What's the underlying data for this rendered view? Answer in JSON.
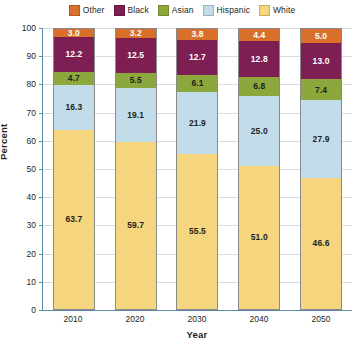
{
  "chart_data": {
    "type": "bar",
    "stacked": true,
    "title": "",
    "xlabel": "Year",
    "ylabel": "Percent",
    "ylim": [
      0,
      100
    ],
    "ytick_step": 10,
    "yticks": [
      100,
      90,
      80,
      70,
      60,
      50,
      40,
      30,
      20,
      10,
      0
    ],
    "grid": true,
    "legend_position": "top",
    "categories": [
      "2010",
      "2020",
      "2030",
      "2040",
      "2050"
    ],
    "series": [
      {
        "name": "Other",
        "color": "#d8702c",
        "label_color": "#ffffff",
        "values": [
          3.0,
          3.2,
          3.8,
          4.4,
          5.0
        ]
      },
      {
        "name": "Black",
        "color": "#7d1f53",
        "label_color": "#ffffff",
        "values": [
          12.2,
          12.5,
          12.7,
          12.8,
          13.0
        ]
      },
      {
        "name": "Asian",
        "color": "#8ca83c",
        "label_color": "#231f20",
        "values": [
          4.7,
          5.5,
          6.1,
          6.8,
          7.4
        ]
      },
      {
        "name": "Hispanic",
        "color": "#c2dcea",
        "label_color": "#231f20",
        "values": [
          16.3,
          19.1,
          21.9,
          25.0,
          27.9
        ]
      },
      {
        "name": "White",
        "color": "#f5d57e",
        "label_color": "#231f20",
        "values": [
          63.7,
          59.7,
          55.5,
          51.0,
          46.6
        ]
      }
    ],
    "stack_order_top_to_bottom": [
      "Other",
      "Black",
      "Asian",
      "Hispanic",
      "White"
    ],
    "axis_color": "#5b8ca8",
    "grid_color": "#d7dde0",
    "background_color": "#ffffff"
  }
}
